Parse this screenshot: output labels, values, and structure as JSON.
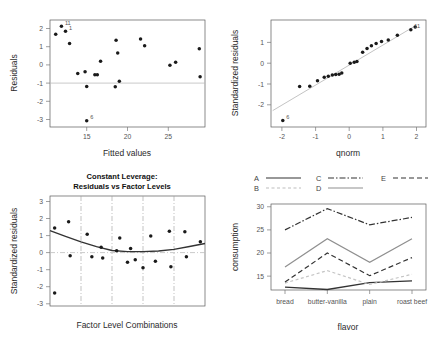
{
  "figure": {
    "kind": "regression-diagnostics-panel",
    "panel_count": 4
  },
  "chart_data": [
    {
      "id": "residuals-vs-fitted",
      "type": "scatter",
      "title": "",
      "xlabel": "Fitted values",
      "ylabel": "Residuals",
      "xlim": [
        10.5,
        29.5
      ],
      "ylim": [
        -3.5,
        2.4
      ],
      "xticks": [
        15,
        20,
        25
      ],
      "yticks": [
        -3,
        -2,
        -1,
        0,
        1,
        2
      ],
      "grid": false,
      "zero_line": 0,
      "points": [
        {
          "x": 11.2,
          "y": 1.62
        },
        {
          "x": 11.9,
          "y": 2.05,
          "label": "11"
        },
        {
          "x": 12.4,
          "y": 1.78,
          "label": "1"
        },
        {
          "x": 12.9,
          "y": 1.1
        },
        {
          "x": 13.9,
          "y": -0.55
        },
        {
          "x": 14.8,
          "y": -0.45
        },
        {
          "x": 15.0,
          "y": -1.27
        },
        {
          "x": 15.0,
          "y": -3.15,
          "label": "6"
        },
        {
          "x": 16.0,
          "y": -0.62
        },
        {
          "x": 16.3,
          "y": -0.62
        },
        {
          "x": 16.7,
          "y": 0.13
        },
        {
          "x": 18.6,
          "y": 1.28
        },
        {
          "x": 18.8,
          "y": 0.58
        },
        {
          "x": 18.5,
          "y": -1.28
        },
        {
          "x": 19.0,
          "y": -0.98
        },
        {
          "x": 21.6,
          "y": 1.35
        },
        {
          "x": 22.1,
          "y": 0.98
        },
        {
          "x": 25.2,
          "y": -0.1
        },
        {
          "x": 25.9,
          "y": 0.07
        },
        {
          "x": 28.8,
          "y": 0.82
        },
        {
          "x": 28.9,
          "y": -0.73
        }
      ]
    },
    {
      "id": "normal-qq",
      "type": "scatter",
      "title": "",
      "xlabel": "qnorm",
      "ylabel": "Standardized residuals",
      "xlim": [
        -2.3,
        2.3
      ],
      "ylim": [
        -2.9,
        2.0
      ],
      "xticks": [
        -2,
        -1,
        0,
        1,
        2
      ],
      "yticks": [
        -2,
        -1,
        0,
        1
      ],
      "grid": false,
      "reference_line": {
        "type": "qq-line",
        "from": [
          -2.25,
          -2.15
        ],
        "to": [
          2.0,
          1.75
        ]
      },
      "points": [
        {
          "x": -1.95,
          "y": -2.6,
          "label": "6"
        },
        {
          "x": -1.45,
          "y": -1.05
        },
        {
          "x": -1.15,
          "y": -1.03
        },
        {
          "x": -0.92,
          "y": -0.78
        },
        {
          "x": -0.72,
          "y": -0.62
        },
        {
          "x": -0.6,
          "y": -0.58
        },
        {
          "x": -0.48,
          "y": -0.52
        },
        {
          "x": -0.38,
          "y": -0.5
        },
        {
          "x": -0.28,
          "y": -0.48
        },
        {
          "x": -0.2,
          "y": -0.43
        },
        {
          "x": 0.05,
          "y": 0.02
        },
        {
          "x": 0.17,
          "y": 0.06
        },
        {
          "x": 0.25,
          "y": 0.1
        },
        {
          "x": 0.42,
          "y": 0.52
        },
        {
          "x": 0.55,
          "y": 0.7
        },
        {
          "x": 0.68,
          "y": 0.82
        },
        {
          "x": 0.82,
          "y": 0.92
        },
        {
          "x": 0.98,
          "y": 1.02
        },
        {
          "x": 1.18,
          "y": 1.08
        },
        {
          "x": 1.45,
          "y": 1.3
        },
        {
          "x": 1.85,
          "y": 1.55,
          "label": "11"
        },
        {
          "x": 1.98,
          "y": 1.68
        }
      ]
    },
    {
      "id": "constant-leverage",
      "type": "scatter",
      "title": "Constant Leverage:\nResiduals vs Factor Levels",
      "title_line1": "Constant Leverage:",
      "title_line2": "Residuals vs Factor Levels",
      "xlabel": "Factor Level Combinations",
      "ylabel": "Standardized residuals",
      "ylim": [
        -3.4,
        3.2
      ],
      "yticks": [
        -3,
        -2,
        -1,
        0,
        1,
        2,
        3
      ],
      "xticks": [],
      "grid": true,
      "gridlines_x": [
        0.2,
        0.4,
        0.6,
        0.8
      ],
      "zero_line": 0,
      "smoother": "loess",
      "points": [
        {
          "x": 0.03,
          "y": 1.28
        },
        {
          "x": 0.03,
          "y": -2.62
        },
        {
          "x": 0.12,
          "y": 1.65
        },
        {
          "x": 0.13,
          "y": -0.38
        },
        {
          "x": 0.24,
          "y": 0.9
        },
        {
          "x": 0.27,
          "y": -0.45
        },
        {
          "x": 0.33,
          "y": 0.12
        },
        {
          "x": 0.34,
          "y": -0.52
        },
        {
          "x": 0.45,
          "y": 0.68
        },
        {
          "x": 0.43,
          "y": -0.09
        },
        {
          "x": 0.52,
          "y": 0.05
        },
        {
          "x": 0.5,
          "y": -0.78
        },
        {
          "x": 0.55,
          "y": -0.62
        },
        {
          "x": 0.6,
          "y": -1.1
        },
        {
          "x": 0.65,
          "y": 0.8
        },
        {
          "x": 0.68,
          "y": -0.72
        },
        {
          "x": 0.77,
          "y": 1.08
        },
        {
          "x": 0.78,
          "y": -1.05
        },
        {
          "x": 0.87,
          "y": 1.05
        },
        {
          "x": 0.88,
          "y": -0.45
        },
        {
          "x": 0.97,
          "y": 0.45
        }
      ],
      "smoother_points": [
        {
          "x": 0.0,
          "y": 1.12
        },
        {
          "x": 0.1,
          "y": 0.78
        },
        {
          "x": 0.2,
          "y": 0.45
        },
        {
          "x": 0.3,
          "y": 0.16
        },
        {
          "x": 0.4,
          "y": -0.07
        },
        {
          "x": 0.5,
          "y": -0.14
        },
        {
          "x": 0.6,
          "y": -0.14
        },
        {
          "x": 0.7,
          "y": -0.1
        },
        {
          "x": 0.8,
          "y": 0.0
        },
        {
          "x": 0.9,
          "y": 0.17
        },
        {
          "x": 1.0,
          "y": 0.35
        }
      ]
    },
    {
      "id": "interaction-plot",
      "type": "line",
      "title": "",
      "xlabel": "flavor",
      "ylabel": "consumption",
      "categories": [
        "bread",
        "butter-vanilla",
        "plain",
        "roast beef"
      ],
      "yticks": [
        15,
        20,
        25,
        30
      ],
      "ylim": [
        12.0,
        30.6
      ],
      "grid": false,
      "legend_position": "top",
      "legend_entries": [
        "A",
        "B",
        "C",
        "D",
        "E"
      ],
      "series": [
        {
          "name": "A",
          "style": "solid-dark",
          "values": [
            12.6,
            12.1,
            13.6,
            14.0
          ]
        },
        {
          "name": "B",
          "style": "dotted",
          "values": [
            13.5,
            16.2,
            13.2,
            15.4
          ]
        },
        {
          "name": "C",
          "style": "dash-dot",
          "values": [
            25.0,
            29.6,
            26.1,
            27.7
          ]
        },
        {
          "name": "D",
          "style": "solid-light",
          "values": [
            17.0,
            23.1,
            18.0,
            23.1
          ]
        },
        {
          "name": "E",
          "style": "dashed",
          "values": [
            13.7,
            20.0,
            15.1,
            19.0
          ]
        }
      ]
    }
  ]
}
